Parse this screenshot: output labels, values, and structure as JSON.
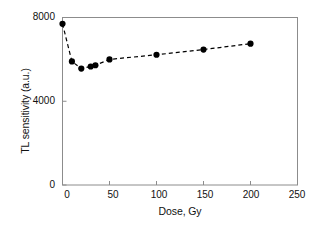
{
  "chart_data": {
    "type": "line",
    "title": "",
    "xlabel": "Dose, Gy",
    "ylabel": "TL sensitivity (a.u.)",
    "xlim": [
      0,
      250
    ],
    "ylim": [
      0,
      8000
    ],
    "xticks": [
      0,
      50,
      100,
      150,
      200,
      250
    ],
    "xticklabels": [
      "0",
      "50",
      "100",
      "150",
      "200",
      "250"
    ],
    "yticks": [
      0,
      4000,
      8000
    ],
    "yticklabels": [
      "0",
      "4000",
      "8000"
    ],
    "grid": false,
    "legend": null,
    "marker": "filled-circle",
    "linestyle": "dashed",
    "line_color": "#000000",
    "marker_color": "#000000",
    "series": [
      {
        "name": "TL sensitivity",
        "x": [
          0,
          10,
          20,
          30,
          35,
          50,
          100,
          150,
          200
        ],
        "y": [
          7700,
          5900,
          5560,
          5660,
          5720,
          6000,
          6220,
          6470,
          6750
        ]
      }
    ]
  },
  "axes": {
    "frame_color": "#888888",
    "tick_color": "#888888",
    "background": "#ffffff"
  }
}
